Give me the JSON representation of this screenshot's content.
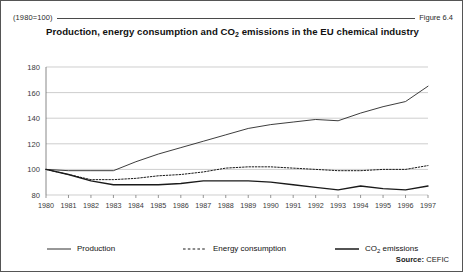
{
  "figure": {
    "base_note": "(1980=100)",
    "figure_number": "Figure 6.4",
    "source_label": "Source:",
    "source_value": "CEFIC"
  },
  "chart_data": {
    "type": "line",
    "title": "Production, energy consumption and CO2 emissions in the EU chemical industry",
    "title_main_pre": "Production, energy consumption and CO",
    "title_sub": "2",
    "title_main_post": " emissions in the EU chemical industry",
    "xlabel": "",
    "ylabel": "",
    "ylim": [
      80,
      180
    ],
    "yticks": [
      80,
      100,
      120,
      140,
      160,
      180
    ],
    "grid": true,
    "legend_position": "bottom",
    "categories": [
      "1980",
      "1981",
      "1982",
      "1983",
      "1984",
      "1985",
      "1986",
      "1987",
      "1988",
      "1989",
      "1990",
      "1991",
      "1992",
      "1993",
      "1994",
      "1995",
      "1996",
      "1997"
    ],
    "x": [
      1980,
      1981,
      1982,
      1983,
      1984,
      1985,
      1986,
      1987,
      1988,
      1989,
      1990,
      1991,
      1992,
      1993,
      1994,
      1995,
      1996,
      1997
    ],
    "series": [
      {
        "name": "Production",
        "style": "solid-thin",
        "color": "#1a1a1a",
        "values": [
          100,
          99,
          99,
          99,
          106,
          112,
          117,
          122,
          127,
          132,
          135,
          137,
          139,
          138,
          144,
          149,
          153,
          165
        ]
      },
      {
        "name": "Energy consumption",
        "style": "dashed",
        "color": "#1a1a1a",
        "values": [
          100,
          96,
          92,
          92,
          93,
          95,
          96,
          98,
          101,
          102,
          102,
          101,
          100,
          99,
          99,
          100,
          100,
          103
        ]
      },
      {
        "name": "CO2 emissions",
        "style": "solid-thick",
        "color": "#1a1a1a",
        "values": [
          100,
          96,
          91,
          88,
          88,
          88,
          89,
          91,
          91,
          91,
          90,
          88,
          86,
          84,
          87,
          85,
          84,
          87
        ]
      }
    ],
    "legend": [
      {
        "label_pre": "Production",
        "label_sub": "",
        "label_post": "",
        "style": "solid-thin"
      },
      {
        "label_pre": "Energy consumption",
        "label_sub": "",
        "label_post": "",
        "style": "dashed"
      },
      {
        "label_pre": "CO",
        "label_sub": "2",
        "label_post": " emissions",
        "style": "solid-thick"
      }
    ]
  }
}
